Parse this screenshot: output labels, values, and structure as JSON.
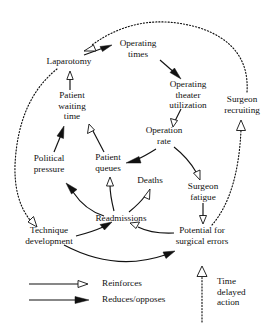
{
  "diagram": {
    "type": "causal-loop-diagram",
    "nodes": [
      {
        "id": "laparotomy",
        "label": "Laparotomy",
        "lines": [
          "Laparotomy"
        ],
        "x": 69,
        "y": 62
      },
      {
        "id": "operating_times",
        "label": "Operating times",
        "lines": [
          "Operating",
          "times"
        ],
        "x": 138,
        "y": 49
      },
      {
        "id": "ot_utilization",
        "label": "Operating theater utilization",
        "lines": [
          "Operating",
          "theater",
          "utilization"
        ],
        "x": 188,
        "y": 95
      },
      {
        "id": "surgeon_recruiting",
        "label": "Surgeon recruiting",
        "lines": [
          "Surgeon",
          "recruiting"
        ],
        "x": 242,
        "y": 105
      },
      {
        "id": "patient_waiting",
        "label": "Patient waiting time",
        "lines": [
          "Patient",
          "waiting",
          "time"
        ],
        "x": 72,
        "y": 106
      },
      {
        "id": "operation_rate",
        "label": "Operation rate",
        "lines": [
          "Operation",
          "rate"
        ],
        "x": 164,
        "y": 136
      },
      {
        "id": "political_pressure",
        "label": "Political pressure",
        "lines": [
          "Political",
          "pressure"
        ],
        "x": 49,
        "y": 164
      },
      {
        "id": "patient_queues",
        "label": "Patient queues",
        "lines": [
          "Patient",
          "queues"
        ],
        "x": 108,
        "y": 163
      },
      {
        "id": "deaths",
        "label": "Deaths",
        "lines": [
          "Deaths"
        ],
        "x": 150,
        "y": 181
      },
      {
        "id": "surgeon_fatigue",
        "label": "Surgeon fatigue",
        "lines": [
          "Surgeon",
          "fatigue"
        ],
        "x": 203,
        "y": 192
      },
      {
        "id": "readmissions",
        "label": "Readmissions",
        "lines": [
          "Readmissions"
        ],
        "x": 121,
        "y": 219
      },
      {
        "id": "technique_dev",
        "label": "Technique development",
        "lines": [
          "Technique",
          "development"
        ],
        "x": 49,
        "y": 236
      },
      {
        "id": "surgical_errors",
        "label": "Potential for surgical errors",
        "lines": [
          "Potential for",
          "surgical errors"
        ],
        "x": 202,
        "y": 236
      }
    ],
    "links": [
      {
        "from": "laparotomy",
        "to": "operating_times",
        "kind": "reduces"
      },
      {
        "from": "operating_times",
        "to": "ot_utilization",
        "kind": "reduces"
      },
      {
        "from": "ot_utilization",
        "to": "operation_rate",
        "kind": "reinforces"
      },
      {
        "from": "operation_rate",
        "to": "patient_queues",
        "kind": "reduces"
      },
      {
        "from": "operation_rate",
        "to": "surgeon_fatigue",
        "kind": "reinforces"
      },
      {
        "from": "surgeon_fatigue",
        "to": "surgical_errors",
        "kind": "reinforces"
      },
      {
        "from": "surgical_errors",
        "to": "surgeon_recruiting",
        "kind": "reinforces",
        "delayed": true
      },
      {
        "from": "surgeon_recruiting",
        "to": "laparotomy",
        "kind": "reinforces",
        "delayed": true
      },
      {
        "from": "surgical_errors",
        "to": "readmissions",
        "kind": "reinforces"
      },
      {
        "from": "technique_dev",
        "to": "readmissions",
        "kind": "reduces"
      },
      {
        "from": "technique_dev",
        "to": "surgical_errors",
        "kind": "reduces"
      },
      {
        "from": "readmissions",
        "to": "deaths",
        "kind": "reinforces"
      },
      {
        "from": "readmissions",
        "to": "patient_queues",
        "kind": "reinforces"
      },
      {
        "from": "readmissions",
        "to": "political_pressure",
        "kind": "reduces"
      },
      {
        "from": "patient_queues",
        "to": "patient_waiting",
        "kind": "reinforces"
      },
      {
        "from": "political_pressure",
        "to": "patient_waiting",
        "kind": "reduces"
      },
      {
        "from": "patient_waiting",
        "to": "laparotomy",
        "kind": "reinforces"
      },
      {
        "from": "laparotomy",
        "to": "technique_dev",
        "kind": "reinforces",
        "delayed": true
      }
    ]
  },
  "legend": {
    "items": [
      {
        "id": "reinforces",
        "label": "Reinforces",
        "head": "open"
      },
      {
        "id": "reduces",
        "label": "Reduces/opposes",
        "head": "filled"
      }
    ],
    "delay": {
      "id": "time-delayed-action",
      "lines": [
        "Time",
        "delayed",
        "action"
      ],
      "label": "Time delayed action"
    }
  }
}
